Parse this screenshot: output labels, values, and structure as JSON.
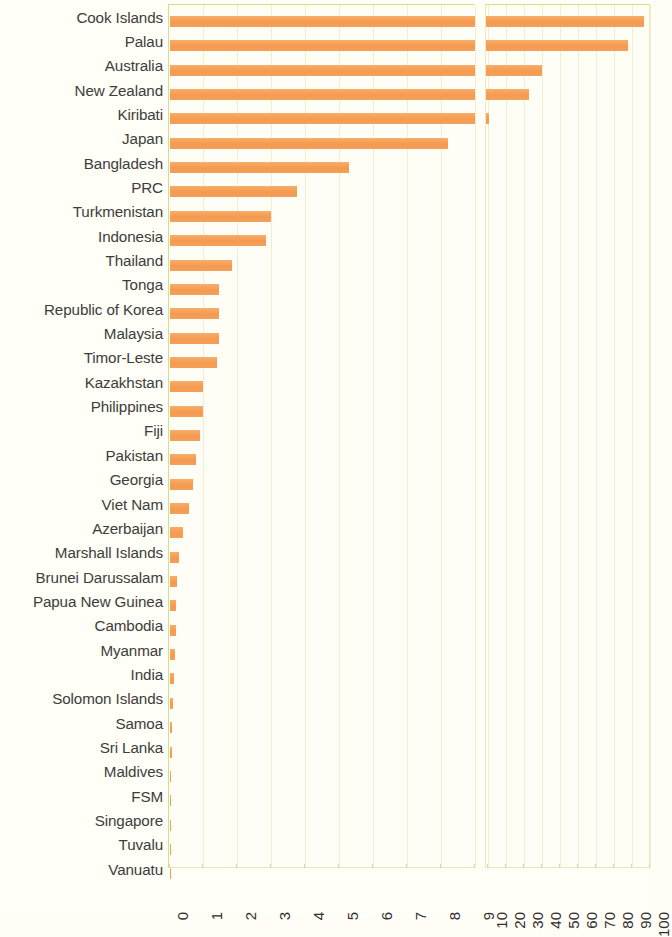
{
  "chart_data": {
    "type": "bar",
    "orientation": "horizontal",
    "title": "",
    "subtitle": "",
    "xlabel": "",
    "ylabel": "",
    "grid": true,
    "legend": null,
    "axis_break": {
      "present": true,
      "left_segment": {
        "min": 0,
        "max": 9,
        "scale": "linear"
      },
      "right_segment": {
        "min": 10,
        "max": 100,
        "scale": "linear-compressed"
      }
    },
    "x_tick_labels": [
      "0",
      "1",
      "2",
      "3",
      "4",
      "5",
      "6",
      "7",
      "8",
      "9",
      "10",
      "20",
      "30",
      "40",
      "50",
      "60",
      "70",
      "80",
      "90",
      "100"
    ],
    "bar_color": "#f5a25b",
    "categories": [
      "Cook Islands",
      "Palau",
      "Australia",
      "New Zealand",
      "Kiribati",
      "Japan",
      "Bangladesh",
      "PRC",
      "Turkmenistan",
      "Indonesia",
      "Thailand",
      "Tonga",
      "Republic of Korea",
      "Malaysia",
      "Timor-Leste",
      "Kazakhstan",
      "Philippines",
      "Fiji",
      "Pakistan",
      "Georgia",
      "Viet Nam",
      "Azerbaijan",
      "Marshall Islands",
      "Brunei Darussalam",
      "Papua New Guinea",
      "Cambodia",
      "Myanmar",
      "India",
      "Solomon Islands",
      "Samoa",
      "Sri Lanka",
      "Maldives",
      "FSM",
      "Singapore",
      "Tuvalu",
      "Vanuatu"
    ],
    "values": [
      97.0,
      88.0,
      40.0,
      33.0,
      11.0,
      8.2,
      5.3,
      3.75,
      3.0,
      2.85,
      1.85,
      1.45,
      1.45,
      1.45,
      1.4,
      1.0,
      1.0,
      0.9,
      0.78,
      0.68,
      0.58,
      0.4,
      0.27,
      0.22,
      0.2,
      0.18,
      0.16,
      0.14,
      0.11,
      0.08,
      0.06,
      0.05,
      0.03,
      0.02,
      0.01,
      0.005
    ]
  }
}
